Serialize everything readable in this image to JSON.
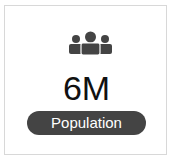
{
  "card": {
    "icon": "people-group-icon",
    "value": "6M",
    "label": "Population",
    "colors": {
      "pill": "#444444",
      "icon": "#444444",
      "text": "#111111"
    }
  }
}
